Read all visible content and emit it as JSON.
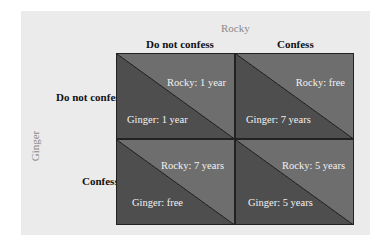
{
  "diagram": {
    "column_player": "Rocky",
    "row_player": "Ginger",
    "columns": [
      "Do not confess",
      "Confess"
    ],
    "rows": [
      "Do not confess",
      "Confess"
    ],
    "cells": [
      [
        {
          "rocky": "Rocky: 1 year",
          "ginger": "Ginger: 1 year"
        },
        {
          "rocky": "Rocky: free",
          "ginger": "Ginger: 7 years"
        }
      ],
      [
        {
          "rocky": "Rocky: 7 years",
          "ginger": "Ginger: free"
        },
        {
          "rocky": "Rocky: 5 years",
          "ginger": "Ginger: 5 years"
        }
      ]
    ],
    "colors": {
      "upper_triangle": "#6e6e6e",
      "lower_triangle": "#4e4e4e",
      "panel": "#ebebeb"
    }
  }
}
